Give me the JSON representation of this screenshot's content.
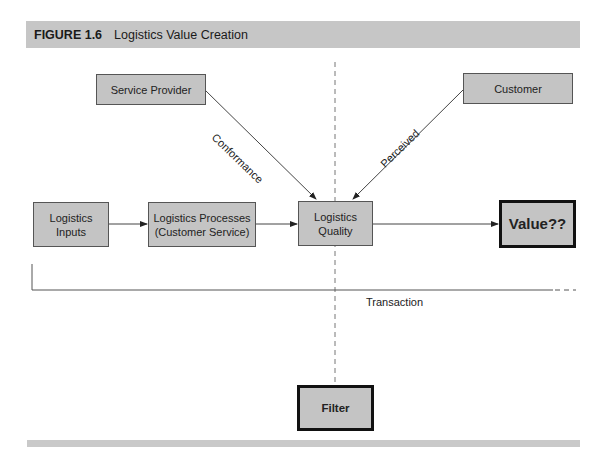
{
  "figure": {
    "number": "FIGURE 1.6",
    "title": "Logistics Value Creation"
  },
  "nodes": {
    "service_provider": "Service Provider",
    "customer": "Customer",
    "logistics_inputs": "Logistics\nInputs",
    "logistics_processes": "Logistics Processes\n(Customer Service)",
    "logistics_quality": "Logistics\nQuality",
    "value": "Value??",
    "filter": "Filter"
  },
  "edge_labels": {
    "conformance": "Conformance",
    "perceived": "Perceived",
    "transaction": "Transaction"
  },
  "colors": {
    "box_fill": "#c4c4c4",
    "bar_fill": "#c6c6c6",
    "line": "#444444"
  }
}
